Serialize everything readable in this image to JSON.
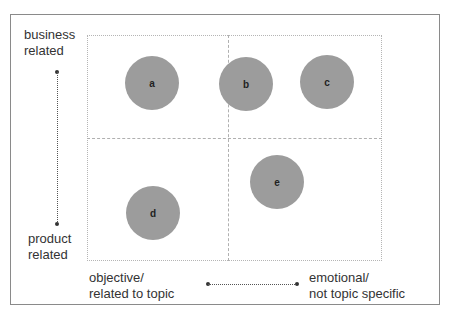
{
  "diagram": {
    "type": "quadrant-bubble-matrix",
    "y_axis": {
      "top_label_line1": "business",
      "top_label_line2": "related",
      "bottom_label_line1": "product",
      "bottom_label_line2": "related"
    },
    "x_axis": {
      "left_label_line1": "objective/",
      "left_label_line2": "related to topic",
      "right_label_line1": "emotional/",
      "right_label_line2": "not topic specific"
    },
    "bubbles": [
      {
        "id": "a",
        "label": "a",
        "quadrant": "top-left"
      },
      {
        "id": "b",
        "label": "b",
        "quadrant": "top-right"
      },
      {
        "id": "c",
        "label": "c",
        "quadrant": "top-right"
      },
      {
        "id": "d",
        "label": "d",
        "quadrant": "bottom-left"
      },
      {
        "id": "e",
        "label": "e",
        "quadrant": "bottom-right"
      }
    ],
    "colors": {
      "bubble": "#9c9c9c",
      "frame": "#8a8a8a",
      "grid": "#b0b0b0",
      "text": "#333333"
    }
  }
}
